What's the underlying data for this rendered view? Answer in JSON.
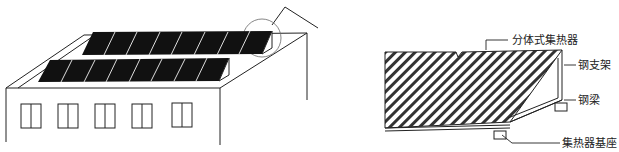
{
  "diagram": {
    "left_figure": {
      "description": "Building rooftop with two rows of solar collector panels",
      "panel_rows": 2,
      "panels_per_row": [
        8,
        8
      ],
      "windows": 5
    },
    "right_figure": {
      "description": "Detail of split-type collector mounting",
      "labels": {
        "collector": "分体式集热器",
        "steel_bracket": "钢支架",
        "steel_beam": "钢梁",
        "collector_base": "集热器基座"
      }
    }
  },
  "colors": {
    "line": "#222222",
    "panel": "#111111",
    "background": "#ffffff"
  }
}
